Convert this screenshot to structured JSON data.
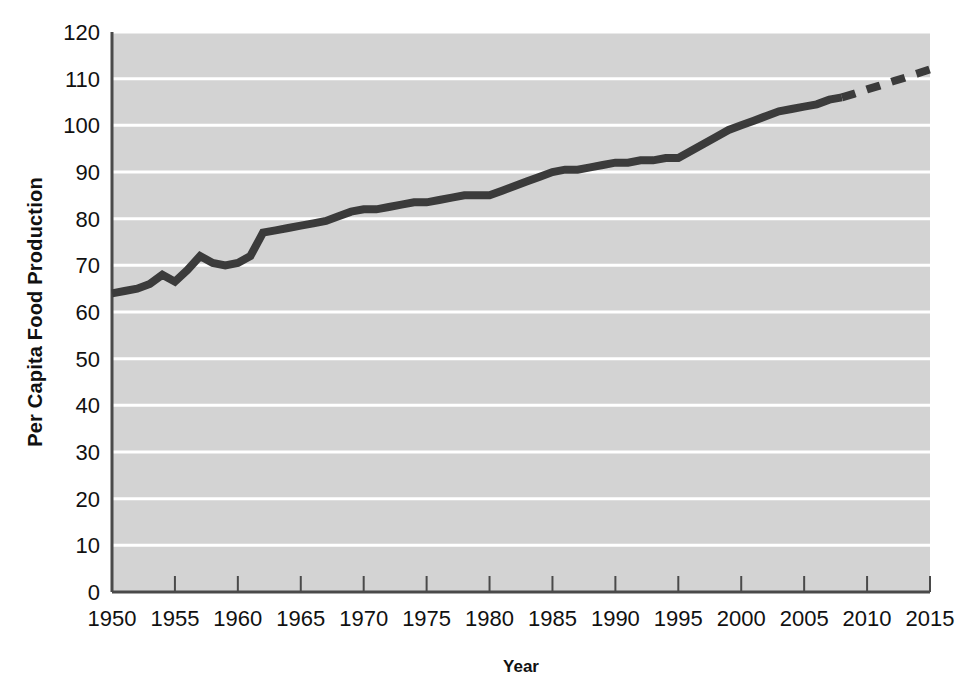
{
  "chart_data": {
    "type": "line",
    "title": "",
    "xlabel": "Year",
    "ylabel": "Per Capita Food Production",
    "xlim": [
      1950,
      2015
    ],
    "ylim": [
      0,
      120
    ],
    "xticks": [
      1950,
      1955,
      1960,
      1965,
      1970,
      1975,
      1980,
      1985,
      1990,
      1995,
      2000,
      2005,
      2010,
      2015
    ],
    "yticks": [
      0,
      10,
      20,
      30,
      40,
      50,
      60,
      70,
      80,
      90,
      100,
      110,
      120
    ],
    "grid": "horizontal-white-lines",
    "legend": "none",
    "plot_background_color": "#d3d3d3",
    "line_color": "#3b3b3b",
    "series": [
      {
        "name": "Per Capita Food Production (historical)",
        "style": "solid",
        "x": [
          1950,
          1951,
          1952,
          1953,
          1954,
          1955,
          1956,
          1957,
          1958,
          1959,
          1960,
          1961,
          1962,
          1963,
          1964,
          1965,
          1966,
          1967,
          1968,
          1969,
          1970,
          1971,
          1972,
          1973,
          1974,
          1975,
          1976,
          1977,
          1978,
          1979,
          1980,
          1981,
          1982,
          1983,
          1984,
          1985,
          1986,
          1987,
          1988,
          1989,
          1990,
          1991,
          1992,
          1993,
          1994,
          1995,
          1996,
          1997,
          1998,
          1999,
          2000,
          2001,
          2002,
          2003,
          2004,
          2005,
          2006,
          2007,
          2008
        ],
        "values": [
          64,
          64.5,
          65,
          66,
          68,
          66.5,
          69,
          72,
          70.5,
          70,
          70.5,
          72,
          77,
          77.5,
          78,
          78.5,
          79,
          79.5,
          80.5,
          81.5,
          82,
          82,
          82.5,
          83,
          83.5,
          83.5,
          84,
          84.5,
          85,
          85,
          85,
          86,
          87,
          88,
          89,
          90,
          90.5,
          90.5,
          91,
          91.5,
          92,
          92,
          92.5,
          92.5,
          93,
          93,
          94.5,
          96,
          97.5,
          99,
          100,
          101,
          102,
          103,
          103.5,
          104,
          104.5,
          105.5,
          106
        ]
      },
      {
        "name": "Per Capita Food Production (projected)",
        "style": "dashed",
        "x": [
          2008,
          2009,
          2010,
          2011,
          2012,
          2013,
          2014,
          2015
        ],
        "values": [
          106,
          106.8,
          107.7,
          108.5,
          109.4,
          110.2,
          111.1,
          112
        ]
      }
    ]
  },
  "axis": {
    "y_axis_title": "Per Capita Food Production",
    "x_axis_title": "Year"
  }
}
